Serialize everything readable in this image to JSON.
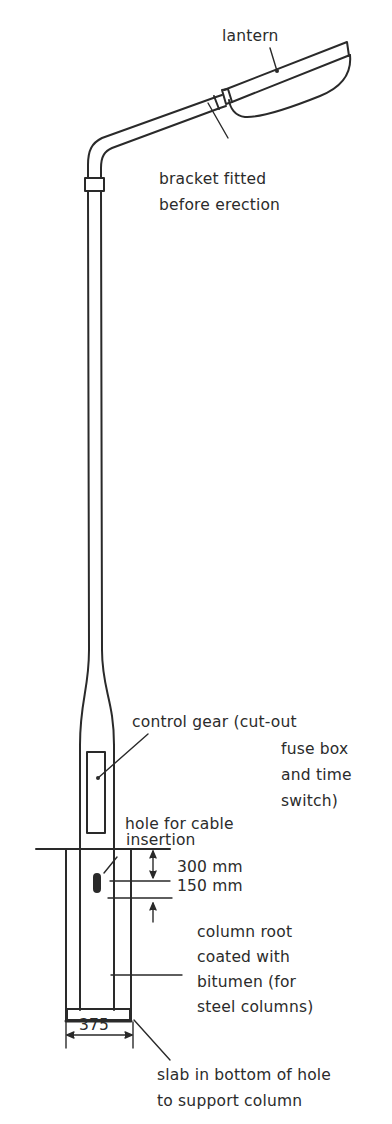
{
  "diagram": {
    "labels": {
      "lantern": "lantern",
      "bracket_line1": "bracket fitted",
      "bracket_line2": "before erection",
      "control_gear_line1": "control gear (cut-out",
      "control_gear_line2": "fuse box",
      "control_gear_line3": "and time",
      "control_gear_line4": "switch)",
      "cable_hole_line1": "hole for cable",
      "cable_hole_line2": "insertion",
      "dim_300": "300 mm",
      "dim_150": "150 mm",
      "root_line1": "column root",
      "root_line2": "coated with",
      "root_line3": "bitumen (for",
      "root_line4": "steel columns)",
      "dim_375": "375",
      "slab_line1": "slab in bottom of hole",
      "slab_line2": "to support column"
    },
    "colors": {
      "line": "#2a2a2a",
      "background": "#ffffff"
    }
  }
}
